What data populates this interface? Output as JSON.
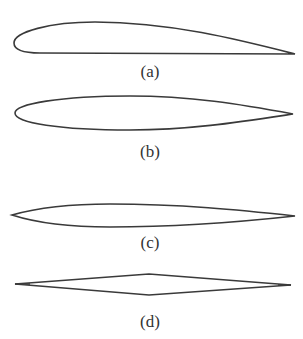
{
  "figure": {
    "stroke_color": "#3a3a3a",
    "background": "#ffffff",
    "panels": [
      {
        "id": "a",
        "label": "(a)",
        "shape": "cambered airfoil (flat bottom, thick rounded leading edge)"
      },
      {
        "id": "b",
        "label": "(b)",
        "shape": "symmetric-ish airfoil with rounded leading edge"
      },
      {
        "id": "c",
        "label": "(c)",
        "shape": "thin biconvex airfoil (sharp leading and trailing edges)"
      },
      {
        "id": "d",
        "label": "(d)",
        "shape": "double-wedge / diamond airfoil"
      }
    ]
  }
}
